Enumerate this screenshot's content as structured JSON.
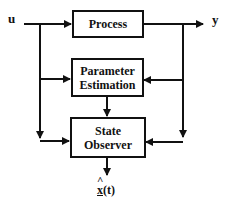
{
  "diagram": {
    "input_label": "u",
    "output_label": "y",
    "blocks": {
      "process": {
        "label": "Process"
      },
      "parameter_estimation": {
        "line1": "Parameter",
        "line2": "Estimation"
      },
      "state_observer": {
        "line1": "State",
        "line2": "Observer"
      }
    },
    "estimate_output": {
      "symbol": "x",
      "hat": "^",
      "suffix": "(t)"
    },
    "colors": {
      "stroke": "#111111",
      "background": "#ffffff"
    }
  }
}
